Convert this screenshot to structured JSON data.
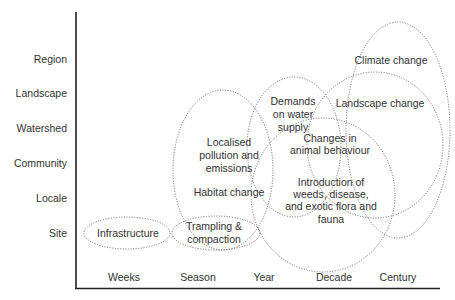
{
  "diagram": {
    "y_axis": {
      "labels": [
        "Region",
        "Landscape",
        "Watershed",
        "Community",
        "Locale",
        "Site"
      ]
    },
    "x_axis": {
      "labels": [
        "Weeks",
        "Season",
        "Year",
        "Decade",
        "Century"
      ]
    },
    "impacts": [
      {
        "id": "infrastructure",
        "lines": [
          "Infrastructure"
        ]
      },
      {
        "id": "trampling",
        "lines": [
          "Trampling &",
          "compaction"
        ]
      },
      {
        "id": "pollution",
        "lines": [
          "Localised",
          "pollution and",
          "emissions"
        ]
      },
      {
        "id": "habitat",
        "lines": [
          "Habitat change"
        ]
      },
      {
        "id": "water",
        "lines": [
          "Demands",
          "on water",
          "supply"
        ]
      },
      {
        "id": "animal",
        "lines": [
          "Changes in",
          "animal behaviour"
        ]
      },
      {
        "id": "weeds",
        "lines": [
          "Introduction of",
          "weeds, disease,",
          "and exotic flora and",
          "fauna"
        ]
      },
      {
        "id": "landscape",
        "lines": [
          "Landscape change"
        ]
      },
      {
        "id": "climate",
        "lines": [
          "Climate change"
        ]
      }
    ]
  }
}
